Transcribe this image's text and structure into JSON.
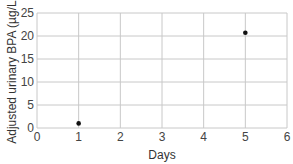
{
  "chart_data": {
    "type": "scatter",
    "title": "",
    "xlabel": "Days",
    "ylabel": "Adjusted urinary BPA (µg/L)",
    "xlim": [
      0,
      6
    ],
    "ylim": [
      0,
      25
    ],
    "xticks": [
      0,
      1,
      2,
      3,
      4,
      5,
      6
    ],
    "yticks": [
      0,
      5,
      10,
      15,
      20,
      25
    ],
    "grid": true,
    "legend": null,
    "series": [
      {
        "name": "BPA",
        "points": [
          {
            "x": 1,
            "y": 1.0
          },
          {
            "x": 5,
            "y": 20.7
          }
        ]
      }
    ]
  },
  "colors": {
    "grid": "#c8c8c8",
    "point": "#111111",
    "text": "#444444"
  }
}
